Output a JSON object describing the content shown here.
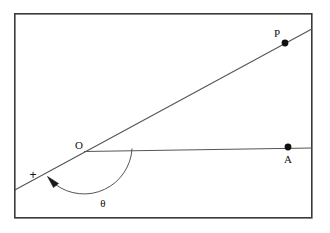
{
  "figure": {
    "background_color": "#ffffff",
    "stroke_color": "#555555",
    "dark_stroke_color": "#3a3a3a",
    "label_color": "#111111",
    "frame": {
      "x": 14,
      "y": 13,
      "width": 298,
      "height": 205,
      "stroke_width": 1.6
    },
    "labels": {
      "point_p": "P",
      "point_a": "A",
      "origin": "O",
      "angle": "θ",
      "direction_marker": "+"
    },
    "points": [
      {
        "name": "P",
        "label": "P",
        "x": 285,
        "y": 43,
        "label_x": 278,
        "label_y": 36,
        "radius": 3.4
      },
      {
        "name": "A",
        "label": "A",
        "x": 288,
        "y": 147,
        "label_x": 288,
        "label_y": 162,
        "radius": 3.4
      },
      {
        "name": "O",
        "label": "O",
        "x": 84,
        "y": 152,
        "label_x": 79,
        "label_y": 149,
        "radius": 0
      }
    ],
    "rays": [
      {
        "name": "horizontal-ray-OA",
        "x1": 84,
        "y1": 151.5,
        "x2": 312,
        "y2": 148,
        "stroke_width": 1.1
      },
      {
        "name": "sloped-line-through-O-and-P",
        "x1": 14,
        "y1": 190,
        "x2": 312,
        "y2": 29,
        "stroke_width": 1.1
      }
    ],
    "angle_arc": {
      "name": "theta-arc",
      "center_x": 84,
      "center_y": 152,
      "radius": 48,
      "start_x": 132,
      "start_y": 148.5,
      "end_x": 56,
      "end_y": 184,
      "label_x": 103,
      "label_y": 206,
      "stroke_width": 1.0,
      "sweep_description": "clockwise from ray OA downward around to lower-left extension of ray PO"
    },
    "arrow_head": {
      "name": "arc-arrowhead",
      "tip_x": 48,
      "tip_y": 177,
      "points": "48,177 58,183 53,187"
    },
    "plus_marker": {
      "name": "plus-direction-marker",
      "x": 33,
      "y": 179
    }
  }
}
